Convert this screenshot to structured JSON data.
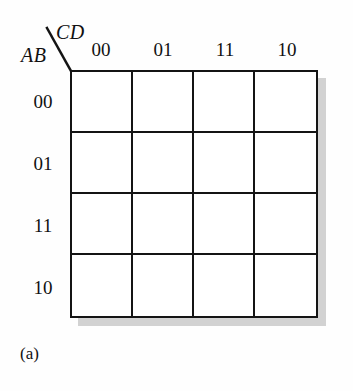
{
  "figure": {
    "caption": "(a)",
    "type": "karnaugh-map",
    "row_variable_label": "AB",
    "column_variable_label": "CD"
  },
  "kmap": {
    "column_headers": [
      "00",
      "01",
      "11",
      "10"
    ],
    "row_headers": [
      "00",
      "01",
      "11",
      "10"
    ],
    "cells": [
      [
        "",
        "",
        "",
        ""
      ],
      [
        "",
        "",
        "",
        ""
      ],
      [
        "",
        "",
        "",
        ""
      ],
      [
        "",
        "",
        "",
        ""
      ]
    ]
  },
  "colors": {
    "line": "#141414",
    "shadow": "#d2d2d2",
    "background": "#fefefe",
    "text": "#111111"
  }
}
